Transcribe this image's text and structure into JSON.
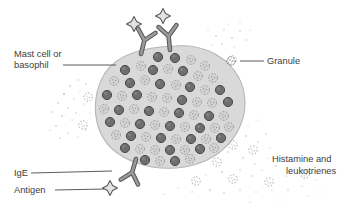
{
  "figure": {
    "kind": "biology-diagram",
    "background_color": "#ffffff"
  },
  "labels": {
    "mast_cell_line1": "Mast cell or",
    "mast_cell_line2": "basophil",
    "granule": "Granule",
    "ige": "IgE",
    "antigen": "Antigen",
    "mediators_line1": "Histamine and",
    "mediators_line2": "leukotrienes"
  },
  "colors": {
    "cell_body": "#d9d9d9",
    "cell_outline": "#b3b3b3",
    "granule_dark": "#6e6e6e",
    "granule_dark_outline": "#4f4f4f",
    "granule_light": "#cfcfcf",
    "granule_light_outline": "#9a9a9a",
    "antibody": "#8c8c8c",
    "antibody_outline": "#555555",
    "antigen_fill": "#e0e0e0",
    "antigen_outline": "#5a5a5a",
    "text": "#3d3d3d",
    "leader_line": "#4a4a4a",
    "speck": "#b8b8b8"
  },
  "elements": {
    "cell_label_leader": "horizontal line from basophil text to cell membrane",
    "granule_icon": "small open stippled circle",
    "ige_icon": "Y-shaped antibody",
    "antigen_icon": "four-point star",
    "released_granules": "stippled circles outside cell with dot clouds"
  },
  "counts": {
    "ige_antibodies_top": 2,
    "ige_antibodies_bottom": 1,
    "antigens": 3
  }
}
